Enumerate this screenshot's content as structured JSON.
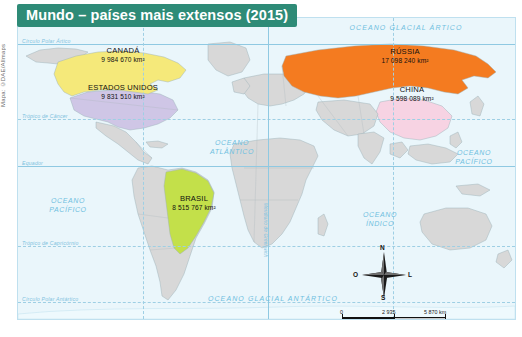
{
  "figure": {
    "title": "Mundo – países mais extensos (2015)",
    "credit": "Mapa: ©DAE/Allmaps",
    "title_bg": "#2e8b77",
    "ocean_color": "#eaf6fb",
    "land_color": "#d8d8d8"
  },
  "countries": [
    {
      "name": "CANADÁ",
      "area": "9 984 670 km²",
      "color": "#f5e97a"
    },
    {
      "name": "ESTADOS UNIDOS",
      "area": "9 831 510 km²",
      "color": "#cfc6e6"
    },
    {
      "name": "RÚSSIA",
      "area": "17 098 240 km²",
      "color": "#f47b20"
    },
    {
      "name": "CHINA",
      "area": "9 598 089 km²",
      "color": "#f7d3e3"
    },
    {
      "name": "BRASIL",
      "area": "8 515 767 km²",
      "color": "#c3e04a"
    }
  ],
  "oceans": [
    {
      "label": "OCEANO GLACIAL ÁRTICO"
    },
    {
      "label": "OCEANO\nATLÂNTICO"
    },
    {
      "label": "OCEANO\nPACÍFICO"
    },
    {
      "label": "OCEANO\nPACÍFICO"
    },
    {
      "label": "OCEANO\nÍNDICO"
    },
    {
      "label": "OCEANO GLACIAL ANTÁRTICO"
    }
  ],
  "graticule": [
    {
      "label": "Círculo Polar Ártico"
    },
    {
      "label": "Trópico de Câncer"
    },
    {
      "label": "Equador"
    },
    {
      "label": "Trópico de Capricórnio"
    },
    {
      "label": "Círculo Polar Antártico"
    },
    {
      "label": "Meridiano de Greenwich"
    }
  ],
  "compass": {
    "north": "N",
    "south": "S",
    "west": "O",
    "east": "L"
  },
  "scale": {
    "zero": "0",
    "mid": "2 935",
    "max": "5 870 km",
    "caption": "1 cm – 2 935 km"
  }
}
